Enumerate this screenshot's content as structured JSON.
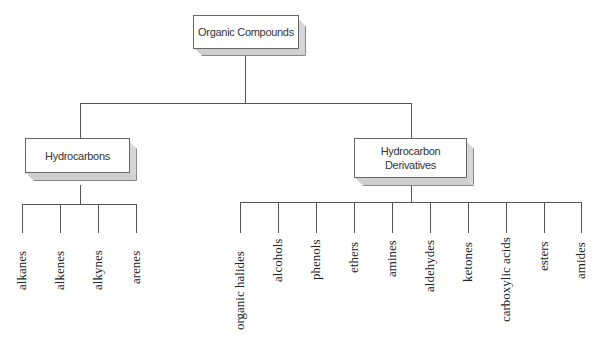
{
  "diagram": {
    "root": {
      "label": "Organic Compounds"
    },
    "branches": [
      {
        "label": "Hydrocarbons",
        "children": [
          "alkanes",
          "alkenes",
          "alkynes",
          "arenes"
        ]
      },
      {
        "label_line1": "Hydrocarbon",
        "label_line2": "Derivatives",
        "children": [
          "organic halides",
          "alcohols",
          "phenols",
          "ethers",
          "amines",
          "aldehydes",
          "ketones",
          "carboxylic acids",
          "esters",
          "amides"
        ]
      }
    ]
  }
}
